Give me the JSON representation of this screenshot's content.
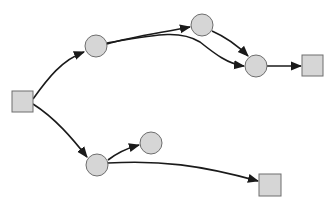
{
  "diagram": {
    "type": "directed-graph",
    "colors": {
      "node_fill": "#d6d6d6",
      "node_stroke": "#6e6e6e",
      "edge": "#1a1a1a",
      "text": "#2a2a2a",
      "background": "#ffffff"
    },
    "nodes": [
      {
        "id": "1",
        "label": "1",
        "shape": "square"
      },
      {
        "id": "2",
        "label": "2",
        "shape": "circle"
      },
      {
        "id": "3",
        "label": "3",
        "shape": "circle"
      },
      {
        "id": "4",
        "label": "4",
        "shape": "circle"
      },
      {
        "id": "5",
        "label": "5",
        "shape": "square"
      },
      {
        "id": "6",
        "label": "6",
        "shape": "circle"
      },
      {
        "id": "7",
        "label": "7",
        "shape": "circle"
      },
      {
        "id": "8",
        "label": "8",
        "shape": "square"
      }
    ],
    "edges": [
      {
        "from": "1",
        "to": "2",
        "label": "X"
      },
      {
        "from": "2",
        "to": "3",
        "label": ""
      },
      {
        "from": "2",
        "to": "4",
        "label": "A"
      },
      {
        "from": "3",
        "to": "4",
        "label": "B"
      },
      {
        "from": "4",
        "to": "5",
        "label": "C"
      },
      {
        "from": "1",
        "to": "6",
        "label": "Y"
      },
      {
        "from": "6",
        "to": "7",
        "label": ""
      },
      {
        "from": "6",
        "to": "8",
        "label": "A"
      },
      {
        "from": "7",
        "to": "8",
        "label": "D"
      }
    ]
  }
}
